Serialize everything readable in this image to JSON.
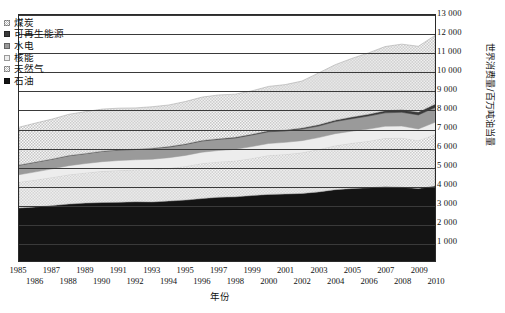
{
  "chart_data": {
    "type": "area",
    "title": "",
    "xlabel": "年份",
    "ylabel": "世界消费量/百万吨油当量",
    "stacked": true,
    "grid": true,
    "legend_position": "top-left",
    "xlim": [
      1985,
      2010
    ],
    "ylim": [
      0,
      13000
    ],
    "yticks": [
      1000,
      2000,
      3000,
      4000,
      5000,
      6000,
      7000,
      8000,
      9000,
      10000,
      11000,
      12000,
      13000
    ],
    "ytick_labels": [
      "1 000",
      "2 000",
      "3 000",
      "4 000",
      "5 000",
      "6 000",
      "7 000",
      "8 000",
      "9 000",
      "10 000",
      "11 000",
      "12 000",
      "13 000"
    ],
    "x": [
      1985,
      1986,
      1987,
      1988,
      1989,
      1990,
      1991,
      1992,
      1993,
      1994,
      1995,
      1996,
      1997,
      1998,
      1999,
      2000,
      2001,
      2002,
      2003,
      2004,
      2005,
      2006,
      2007,
      2008,
      2009,
      2010
    ],
    "xtick_labels_row0": [
      "1985",
      "1987",
      "1989",
      "1991",
      "1993",
      "1995",
      "1997",
      "1999",
      "2001",
      "2003",
      "2005",
      "2007",
      "2009"
    ],
    "xtick_labels_row1": [
      "1986",
      "1988",
      "1990",
      "1992",
      "1994",
      "1996",
      "1998",
      "2000",
      "2002",
      "2004",
      "2006",
      "2008",
      "2010"
    ],
    "series": [
      {
        "name": "石油",
        "key": "oil",
        "color": "#141414",
        "pattern": "solid",
        "values": [
          2800,
          2860,
          2930,
          3010,
          3060,
          3090,
          3100,
          3130,
          3120,
          3170,
          3220,
          3300,
          3370,
          3390,
          3460,
          3520,
          3540,
          3570,
          3650,
          3770,
          3830,
          3870,
          3930,
          3900,
          3830,
          3960
        ]
      },
      {
        "name": "天然气",
        "key": "gas",
        "color": "#c9c9c9",
        "pattern": "hatch",
        "values": [
          1380,
          1430,
          1500,
          1560,
          1610,
          1660,
          1690,
          1700,
          1720,
          1740,
          1790,
          1870,
          1880,
          1910,
          1970,
          2070,
          2100,
          2160,
          2250,
          2330,
          2400,
          2470,
          2570,
          2610,
          2540,
          2740
        ]
      },
      {
        "name": "核能",
        "key": "nuclear",
        "color": "#ededed",
        "pattern": "solid",
        "values": [
          380,
          420,
          440,
          470,
          480,
          500,
          520,
          520,
          540,
          550,
          570,
          580,
          590,
          600,
          620,
          620,
          630,
          630,
          620,
          630,
          630,
          630,
          620,
          620,
          610,
          630
        ]
      },
      {
        "name": "水电",
        "key": "hydro",
        "color": "#9a9a9a",
        "pattern": "solid",
        "values": [
          500,
          510,
          510,
          520,
          520,
          540,
          550,
          540,
          560,
          560,
          580,
          590,
          590,
          600,
          610,
          620,
          600,
          610,
          610,
          640,
          660,
          690,
          710,
          730,
          740,
          780
        ]
      },
      {
        "name": "可再生能源",
        "key": "renewables",
        "color": "#3a3a3a",
        "pattern": "solid",
        "values": [
          10,
          11,
          12,
          13,
          14,
          16,
          18,
          20,
          22,
          25,
          28,
          31,
          35,
          38,
          42,
          47,
          52,
          58,
          65,
          74,
          84,
          96,
          112,
          130,
          148,
          180
        ]
      },
      {
        "name": "煤炭",
        "key": "coal",
        "color": "#d5d5d5",
        "pattern": "checker",
        "values": [
          2000,
          2060,
          2110,
          2180,
          2210,
          2220,
          2200,
          2180,
          2190,
          2200,
          2240,
          2290,
          2310,
          2280,
          2290,
          2350,
          2400,
          2480,
          2740,
          2930,
          3100,
          3240,
          3390,
          3470,
          3480,
          3630
        ]
      }
    ]
  }
}
